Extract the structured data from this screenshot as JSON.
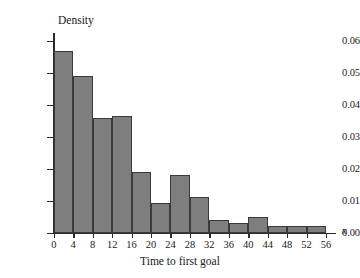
{
  "chart_data": {
    "type": "bar",
    "title": "",
    "xlabel": "Time to first goal",
    "ylabel": "Density",
    "x_variable_symbol": "x",
    "bin_width": 4,
    "bin_edges": [
      0,
      4,
      8,
      12,
      16,
      20,
      24,
      28,
      32,
      36,
      40,
      44,
      48,
      52,
      56
    ],
    "categories": [
      "0-4",
      "4-8",
      "8-12",
      "12-16",
      "16-20",
      "20-24",
      "24-28",
      "28-32",
      "32-36",
      "36-40",
      "40-44",
      "44-48",
      "48-52",
      "52-56"
    ],
    "values": [
      0.057,
      0.049,
      0.036,
      0.0365,
      0.019,
      0.0093,
      0.018,
      0.011,
      0.004,
      0.003,
      0.005,
      0.002,
      0.002,
      0.002
    ],
    "xlim": [
      0,
      56
    ],
    "ylim": [
      0.0,
      0.06
    ],
    "xticks": [
      0,
      4,
      8,
      12,
      16,
      20,
      24,
      28,
      32,
      36,
      40,
      44,
      48,
      52,
      56
    ],
    "xtick_labels": [
      "0",
      "4",
      "8",
      "12",
      "16",
      "20",
      "24",
      "28",
      "32",
      "36",
      "40",
      "44",
      "48",
      "52",
      "56"
    ],
    "yticks": [
      0.0,
      0.01,
      0.02,
      0.03,
      0.04,
      0.05,
      0.06
    ],
    "ytick_labels": [
      "0.00",
      "0.01",
      "0.02",
      "0.03",
      "0.04",
      "0.05",
      "0.06"
    ],
    "grid": false,
    "legend": false,
    "bar_fill_color": "#7e7e7e",
    "bar_edge_color": "#3a3a3a",
    "axis_color": "#2b2b2b",
    "background_color": "#ffffff"
  }
}
